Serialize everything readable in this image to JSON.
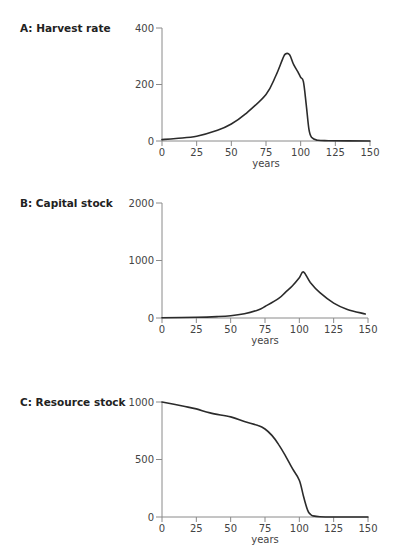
{
  "chart_data": [
    {
      "type": "line",
      "title": "A: Harvest rate",
      "xlabel": "years",
      "ylabel": "",
      "xlim": [
        0,
        150
      ],
      "ylim": [
        0,
        400
      ],
      "xticks": [
        0,
        25,
        50,
        75,
        100,
        125,
        150
      ],
      "yticks": [
        0,
        200,
        400
      ],
      "grid": false,
      "legend": null,
      "x": [
        0,
        10,
        25,
        40,
        50,
        60,
        75,
        82,
        87,
        89,
        92,
        95,
        98,
        100,
        102,
        104,
        106,
        108,
        112,
        120,
        150
      ],
      "values": [
        5,
        9,
        17,
        38,
        60,
        95,
        165,
        230,
        290,
        308,
        305,
        270,
        245,
        225,
        210,
        130,
        40,
        12,
        3,
        1,
        0
      ]
    },
    {
      "type": "line",
      "title": "B: Capital stock",
      "xlabel": "years",
      "ylabel": "",
      "xlim": [
        0,
        150
      ],
      "ylim": [
        0,
        2000
      ],
      "xticks": [
        0,
        25,
        50,
        75,
        100,
        125,
        150
      ],
      "yticks": [
        0,
        1000,
        2000
      ],
      "grid": false,
      "legend": null,
      "x": [
        0,
        25,
        40,
        50,
        60,
        70,
        75,
        85,
        90,
        95,
        100,
        103,
        108,
        115,
        125,
        135,
        148
      ],
      "values": [
        5,
        12,
        25,
        40,
        75,
        140,
        200,
        340,
        450,
        560,
        700,
        800,
        620,
        440,
        260,
        150,
        70
      ]
    },
    {
      "type": "line",
      "title": "C: Resource stock",
      "xlabel": "years",
      "ylabel": "",
      "xlim": [
        0,
        150
      ],
      "ylim": [
        0,
        1000
      ],
      "xticks": [
        0,
        25,
        50,
        75,
        100,
        125,
        150
      ],
      "yticks": [
        0,
        500,
        1000
      ],
      "grid": false,
      "legend": null,
      "x": [
        0,
        15,
        25,
        35,
        50,
        60,
        70,
        75,
        80,
        85,
        90,
        95,
        100,
        103,
        106,
        108,
        110,
        115,
        125,
        150
      ],
      "values": [
        1000,
        965,
        940,
        905,
        870,
        830,
        795,
        765,
        710,
        630,
        530,
        420,
        320,
        180,
        60,
        25,
        10,
        2,
        0,
        0
      ]
    }
  ]
}
